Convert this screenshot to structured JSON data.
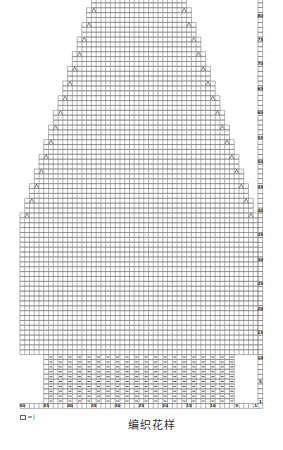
{
  "caption": "编织花样",
  "legend": {
    "symbol_icon": "blank-cell-icon",
    "equals": "=",
    "meaning": "|"
  },
  "chart": {
    "type": "knitting-chart",
    "stitches": 50,
    "rows_shown": 83,
    "colors": {
      "grid_line": "#808080",
      "symbol": "#333333",
      "label": "#1e1e1e",
      "background": "#ffffff"
    },
    "ribbing": {
      "rows": [
        1,
        10
      ],
      "from_col": 45,
      "to_col": 6,
      "purl_on": "even",
      "purl_symbol": "purl-dash-icon"
    },
    "body": {
      "from_row": 11,
      "to_row": 39,
      "from_col": 50,
      "to_col": 1
    },
    "shaping": {
      "first_decrease_row": 39,
      "every_rows": 3,
      "decreases_each_side": 15,
      "symbol": "decrease-icon"
    },
    "column_labels": [
      {
        "col": 50,
        "text": "50"
      },
      {
        "col": 45,
        "text": "45"
      },
      {
        "col": 40,
        "text": "40"
      },
      {
        "col": 35,
        "text": "35"
      },
      {
        "col": 30,
        "text": "30"
      },
      {
        "col": 25,
        "text": "25"
      },
      {
        "col": 20,
        "text": "20"
      },
      {
        "col": 15,
        "text": "15"
      },
      {
        "col": 10,
        "text": "10"
      },
      {
        "col": 5,
        "text": "5"
      },
      {
        "col": 1,
        "text": "1"
      }
    ],
    "row_labels": [
      {
        "row": 1,
        "text": "1"
      },
      {
        "row": 5,
        "text": "5"
      },
      {
        "row": 10,
        "text": "10"
      },
      {
        "row": 15,
        "text": "15"
      },
      {
        "row": 20,
        "text": "20"
      },
      {
        "row": 25,
        "text": "25"
      },
      {
        "row": 30,
        "text": "30"
      },
      {
        "row": 35,
        "text": "35"
      },
      {
        "row": 40,
        "text": "40"
      },
      {
        "row": 45,
        "text": "45"
      },
      {
        "row": 50,
        "text": "50"
      },
      {
        "row": 55,
        "text": "55"
      },
      {
        "row": 60,
        "text": "60"
      },
      {
        "row": 65,
        "text": "65"
      },
      {
        "row": 70,
        "text": "70"
      },
      {
        "row": 75,
        "text": "75"
      },
      {
        "row": 80,
        "text": "80"
      }
    ]
  }
}
